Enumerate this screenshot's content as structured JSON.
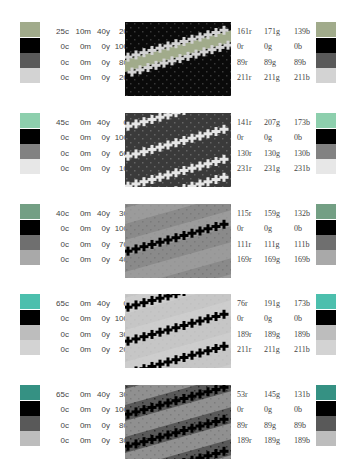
{
  "groups": [
    {
      "pattern_style": "band-light-on-dark",
      "swatch_colors": [
        "#a1ab8b",
        "#000000",
        "#595959",
        "#d3d3d3"
      ],
      "pattern_colors": {
        "bg": "#0a0a0a",
        "band": "#d3d3d3",
        "mid": "#a1ab8b",
        "dot": "#595959"
      },
      "cmyk": [
        {
          "c": "25c",
          "m": "10m",
          "y": "40y",
          "k": "20k"
        },
        {
          "c": "0c",
          "m": "0m",
          "y": "0y",
          "k": "100k"
        },
        {
          "c": "0c",
          "m": "0m",
          "y": "0y",
          "k": "80k"
        },
        {
          "c": "0c",
          "m": "0m",
          "y": "0y",
          "k": "20k"
        }
      ],
      "rgb": [
        {
          "r": "161r",
          "g": "171g",
          "b": "139b"
        },
        {
          "r": "0r",
          "g": "0g",
          "b": "0b"
        },
        {
          "r": "89r",
          "g": "89g",
          "b": "89b"
        },
        {
          "r": "211r",
          "g": "211g",
          "b": "211b"
        }
      ]
    },
    {
      "pattern_style": "checker-mixed",
      "swatch_colors": [
        "#8dcfad",
        "#000000",
        "#828282",
        "#e7e7e7"
      ],
      "pattern_colors": {
        "bg": "#3a3a3a",
        "band": "#e7e7e7",
        "mid": "#8dcfad",
        "dot": "#828282"
      },
      "cmyk": [
        {
          "c": "45c",
          "m": "0m",
          "y": "40y",
          "k": "0k"
        },
        {
          "c": "0c",
          "m": "0m",
          "y": "0y",
          "k": "100k"
        },
        {
          "c": "0c",
          "m": "0m",
          "y": "0y",
          "k": "60k"
        },
        {
          "c": "0c",
          "m": "0m",
          "y": "0y",
          "k": "10k"
        }
      ],
      "rgb": [
        {
          "r": "141r",
          "g": "207g",
          "b": "173b"
        },
        {
          "r": "0r",
          "g": "0g",
          "b": "0b"
        },
        {
          "r": "130r",
          "g": "130g",
          "b": "130b"
        },
        {
          "r": "231r",
          "g": "231g",
          "b": "231b"
        }
      ]
    },
    {
      "pattern_style": "single-dark-line",
      "swatch_colors": [
        "#739f84",
        "#000000",
        "#6f6f6f",
        "#a9a9a9"
      ],
      "pattern_colors": {
        "bg": "#8a8a8a",
        "band": "#a9a9a9",
        "mid": "#739f84",
        "dot": "#6f6f6f"
      },
      "cmyk": [
        {
          "c": "40c",
          "m": "0m",
          "y": "40y",
          "k": "30k"
        },
        {
          "c": "0c",
          "m": "0m",
          "y": "0y",
          "k": "100k"
        },
        {
          "c": "0c",
          "m": "0m",
          "y": "0y",
          "k": "70k"
        },
        {
          "c": "0c",
          "m": "0m",
          "y": "0y",
          "k": "40k"
        }
      ],
      "rgb": [
        {
          "r": "115r",
          "g": "159g",
          "b": "132b"
        },
        {
          "r": "0r",
          "g": "0g",
          "b": "0b"
        },
        {
          "r": "111r",
          "g": "111g",
          "b": "111b"
        },
        {
          "r": "169r",
          "g": "169g",
          "b": "169b"
        }
      ]
    },
    {
      "pattern_style": "triple-dark-lines",
      "swatch_colors": [
        "#4cbfad",
        "#000000",
        "#bdbdbd",
        "#d3d3d3"
      ],
      "pattern_colors": {
        "bg": "#c6c6c6",
        "band": "#d3d3d3",
        "mid": "#4cbfad",
        "dot": "#bdbdbd"
      },
      "cmyk": [
        {
          "c": "65c",
          "m": "0m",
          "y": "40y",
          "k": "0k"
        },
        {
          "c": "0c",
          "m": "0m",
          "y": "0y",
          "k": "100k"
        },
        {
          "c": "0c",
          "m": "0m",
          "y": "0y",
          "k": "30k"
        },
        {
          "c": "0c",
          "m": "0m",
          "y": "0y",
          "k": "20k"
        }
      ],
      "rgb": [
        {
          "r": "76r",
          "g": "191g",
          "b": "173b"
        },
        {
          "r": "0r",
          "g": "0g",
          "b": "0b"
        },
        {
          "r": "189r",
          "g": "189g",
          "b": "189b"
        },
        {
          "r": "211r",
          "g": "211g",
          "b": "211b"
        }
      ]
    },
    {
      "pattern_style": "dark-bands-on-light",
      "swatch_colors": [
        "#359183",
        "#000000",
        "#595959",
        "#bdbdbd"
      ],
      "pattern_colors": {
        "bg": "#595959",
        "band": "#bdbdbd",
        "mid": "#359183",
        "dot": "#111111"
      },
      "cmyk": [
        {
          "c": "65c",
          "m": "0m",
          "y": "40y",
          "k": "30k"
        },
        {
          "c": "0c",
          "m": "0m",
          "y": "0y",
          "k": "100k"
        },
        {
          "c": "0c",
          "m": "0m",
          "y": "0y",
          "k": "80k"
        },
        {
          "c": "0c",
          "m": "0m",
          "y": "0y",
          "k": "30k"
        }
      ],
      "rgb": [
        {
          "r": "53r",
          "g": "145g",
          "b": "131b"
        },
        {
          "r": "0r",
          "g": "0g",
          "b": "0b"
        },
        {
          "r": "89r",
          "g": "89g",
          "b": "89b"
        },
        {
          "r": "189r",
          "g": "189g",
          "b": "189b"
        }
      ]
    }
  ]
}
